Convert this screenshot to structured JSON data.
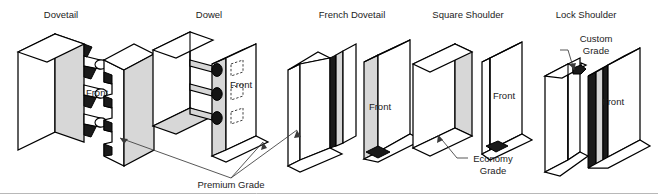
{
  "figure": {
    "type": "technical-illustration",
    "width": 658,
    "height": 194,
    "background_color": "#ffffff",
    "line_color": "#000000",
    "shade_color": "#d7d7d7",
    "dark_color": "#1a1a1a",
    "leader_color": "#3a3a3a"
  },
  "joints": [
    {
      "id": "dovetail",
      "title": "Dovetail",
      "title_x": 61,
      "front_label": "Front",
      "front_label_x": 97,
      "front_label_y": 96,
      "grade": "Premium Grade"
    },
    {
      "id": "dowel",
      "title": "Dowel",
      "title_x": 209,
      "front_label": "Front",
      "front_label_x": 241,
      "front_label_y": 88,
      "grade": "Premium Grade"
    },
    {
      "id": "french-dovetail",
      "title": "French Dovetail",
      "title_x": 352,
      "front_label": "Front",
      "front_label_x": 380,
      "front_label_y": 110,
      "grade": "Premium Grade"
    },
    {
      "id": "square-shoulder",
      "title": "Square Shoulder",
      "title_x": 468,
      "front_label": "Front",
      "front_label_x": 504,
      "front_label_y": 99,
      "grade": "Economy Grade"
    },
    {
      "id": "lock-shoulder",
      "title": "Lock Shoulder",
      "title_x": 586,
      "front_label": "Front",
      "front_label_x": 613,
      "front_label_y": 105,
      "grade": "Custom Grade"
    }
  ],
  "callouts": [
    {
      "id": "premium-grade",
      "label": "Premium Grade",
      "lines": [
        "Premium Grade"
      ],
      "x": 231,
      "y": 188
    },
    {
      "id": "economy-grade",
      "label": "Economy Grade",
      "lines": [
        "Economy",
        "Grade"
      ],
      "x": 493,
      "y": 166
    },
    {
      "id": "custom-grade",
      "label": "Custom Grade",
      "lines": [
        "Custom",
        "Grade"
      ],
      "x": 596,
      "y": 42
    }
  ]
}
